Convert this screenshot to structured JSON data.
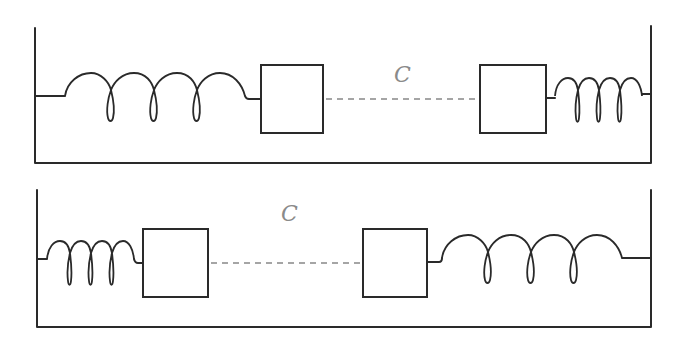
{
  "colors": {
    "line": "#2a2a2a",
    "coupling": "#888888",
    "label": "#8a8a8a",
    "background": "#ffffff"
  },
  "panels": [
    {
      "name": "top-system",
      "label": "C",
      "left_spring": {
        "type": "large",
        "coils": 3
      },
      "right_spring": {
        "type": "small",
        "coils": 3
      },
      "masses": 2,
      "coupling": "dashed"
    },
    {
      "name": "bottom-system",
      "label": "C",
      "left_spring": {
        "type": "small",
        "coils": 3
      },
      "right_spring": {
        "type": "large",
        "coils": 3
      },
      "masses": 2,
      "coupling": "dashed"
    }
  ]
}
